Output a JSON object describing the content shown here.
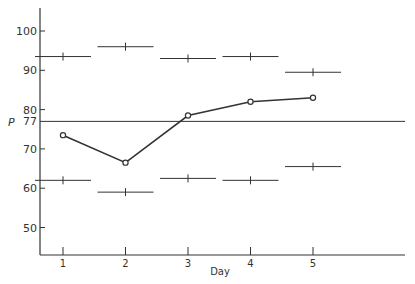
{
  "chart_data": {
    "type": "line",
    "title": "",
    "xlabel": "Day",
    "ylabel": "P",
    "x": [
      1,
      2,
      3,
      4,
      5
    ],
    "x_ticks": [
      "1",
      "2",
      "3",
      "4",
      "5"
    ],
    "y_ticks": [
      50,
      60,
      70,
      80,
      90,
      100
    ],
    "ylim": [
      44,
      106
    ],
    "reference_line": {
      "value": 77,
      "label": "77"
    },
    "series": [
      {
        "name": "P",
        "style": "line-open-circles",
        "values": [
          73.5,
          66.5,
          78.5,
          82,
          83
        ]
      },
      {
        "name": "upper limit",
        "style": "horizontal-bar-tick",
        "values": [
          93.5,
          96,
          93,
          93.5,
          89.5
        ]
      },
      {
        "name": "lower limit",
        "style": "horizontal-bar-tick",
        "values": [
          62,
          59,
          62.5,
          62,
          65.5
        ]
      }
    ],
    "grid": false,
    "legend": null
  },
  "colors": {
    "ink": "#333333",
    "background": "#ffffff"
  }
}
